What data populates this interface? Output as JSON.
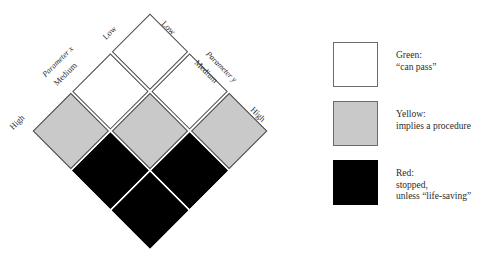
{
  "chart_data": {
    "type": "heatmap",
    "title": "",
    "orientation": "diamond-rotated-45",
    "xlabel": "Parameter x",
    "ylabel": "Parameter y",
    "categories_x": [
      "Low",
      "Medium",
      "High"
    ],
    "categories_y": [
      "Low",
      "Medium",
      "High"
    ],
    "legend_position": "right",
    "grid": true,
    "value_scale": [
      "green",
      "yellow",
      "red"
    ],
    "cells": [
      {
        "x": "Low",
        "y": "Low",
        "value": "green",
        "color": "#ffffff"
      },
      {
        "x": "Low",
        "y": "Medium",
        "value": "green",
        "color": "#ffffff"
      },
      {
        "x": "Low",
        "y": "High",
        "value": "yellow",
        "color": "#c9c9c9"
      },
      {
        "x": "Medium",
        "y": "Low",
        "value": "green",
        "color": "#ffffff"
      },
      {
        "x": "Medium",
        "y": "Medium",
        "value": "yellow",
        "color": "#c9c9c9"
      },
      {
        "x": "Medium",
        "y": "High",
        "value": "red",
        "color": "#000000"
      },
      {
        "x": "High",
        "y": "Low",
        "value": "yellow",
        "color": "#c9c9c9"
      },
      {
        "x": "High",
        "y": "Medium",
        "value": "red",
        "color": "#000000"
      },
      {
        "x": "High",
        "y": "High",
        "value": "red",
        "color": "#000000"
      }
    ],
    "rows": [
      [
        "green",
        "green",
        "yellow"
      ],
      [
        "green",
        "yellow",
        "red"
      ],
      [
        "yellow",
        "red",
        "red"
      ]
    ]
  },
  "matrix": {
    "axis_x": {
      "title": "Parameter x",
      "low": "Low",
      "medium": "Medium",
      "high": "High"
    },
    "axis_y": {
      "title": "Parameter y",
      "low": "Low",
      "medium": "Medium",
      "high": "High"
    }
  },
  "legend": {
    "items": [
      {
        "swatch": "green",
        "color": "#ffffff",
        "lines": [
          "Green:",
          "“can pass”"
        ]
      },
      {
        "swatch": "yellow",
        "color": "#c9c9c9",
        "lines": [
          "Yellow:",
          "implies a procedure"
        ]
      },
      {
        "swatch": "red",
        "color": "#000000",
        "lines": [
          "Red:",
          "stopped,",
          "unless “life-saving”"
        ]
      }
    ]
  }
}
